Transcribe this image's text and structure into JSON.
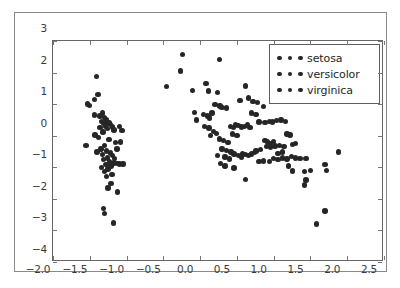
{
  "figure": {
    "background_color": "#ffffff",
    "frame_color": "#8a8a8a",
    "axes_color": "#666666",
    "marker_color": "#262626"
  },
  "legend": {
    "position": "upper-right",
    "entries": [
      {
        "label": "setosa",
        "marker": "circle",
        "color": "#262626"
      },
      {
        "label": "versicolor",
        "marker": "circle",
        "color": "#262626"
      },
      {
        "label": "virginica",
        "marker": "circle",
        "color": "#262626"
      }
    ]
  },
  "chart_data": {
    "type": "scatter",
    "title": "",
    "xlabel": "",
    "ylabel": "",
    "xlim": [
      -2.0,
      2.5
    ],
    "ylim": [
      -4,
      3
    ],
    "grid": false,
    "legend_position": "upper right",
    "xticks": [
      -2.0,
      -1.5,
      -1.0,
      -0.5,
      0.0,
      0.5,
      1.0,
      1.5,
      2.0,
      2.5
    ],
    "xticklabels": [
      "-2.0",
      "-1.5",
      "-1.0",
      "-0.5",
      "0.0",
      "0.5",
      "1.0",
      "1.5",
      "2.0",
      "2.5"
    ],
    "yticks": [
      -4,
      -3,
      -2,
      -1,
      0,
      1,
      2,
      3
    ],
    "yticklabels": [
      "-4",
      "-3",
      "-2",
      "-1",
      "0",
      "1",
      "2",
      "3"
    ],
    "marker_size": 5.4,
    "series": [
      {
        "name": "setosa",
        "color": "#262626",
        "points": [
          [
            -1.53,
            1.0
          ],
          [
            -1.41,
            1.88
          ],
          [
            -1.44,
            1.15
          ],
          [
            -1.39,
            1.3
          ],
          [
            -1.5,
            0.95
          ],
          [
            -1.33,
            0.72
          ],
          [
            -1.36,
            0.62
          ],
          [
            -1.3,
            0.58
          ],
          [
            -1.28,
            0.52
          ],
          [
            -1.34,
            0.46
          ],
          [
            -1.27,
            0.44
          ],
          [
            -1.24,
            0.4
          ],
          [
            -1.31,
            0.38
          ],
          [
            -1.22,
            0.35
          ],
          [
            -1.29,
            0.3
          ],
          [
            -1.19,
            0.28
          ],
          [
            -1.36,
            0.26
          ],
          [
            -1.26,
            0.22
          ],
          [
            -1.17,
            0.18
          ],
          [
            -1.32,
            0.12
          ],
          [
            -1.55,
            -0.3
          ],
          [
            -1.43,
            0.02
          ],
          [
            -1.38,
            -0.06
          ],
          [
            -1.24,
            -0.12
          ],
          [
            -1.15,
            -0.22
          ],
          [
            -1.3,
            -0.3
          ],
          [
            -1.35,
            -0.42
          ],
          [
            -1.27,
            -0.48
          ],
          [
            -1.22,
            -0.55
          ],
          [
            -1.33,
            -0.6
          ],
          [
            -1.4,
            -0.52
          ],
          [
            -1.19,
            -0.62
          ],
          [
            -1.26,
            -0.7
          ],
          [
            -1.31,
            -0.76
          ],
          [
            -1.23,
            -0.82
          ],
          [
            -1.17,
            -0.86
          ],
          [
            -1.12,
            -0.88
          ],
          [
            -1.28,
            -0.92
          ],
          [
            -1.21,
            -0.96
          ],
          [
            -1.34,
            -1.0
          ],
          [
            -1.25,
            -1.06
          ],
          [
            -1.3,
            -1.14
          ],
          [
            -1.2,
            -1.22
          ],
          [
            -1.27,
            -1.3
          ],
          [
            -1.16,
            -0.72
          ],
          [
            -1.1,
            -0.9
          ],
          [
            -1.05,
            -0.9
          ],
          [
            -1.13,
            -0.42
          ],
          [
            -1.08,
            -0.2
          ],
          [
            -1.1,
            0.3
          ],
          [
            -1.06,
            0.16
          ],
          [
            -1.44,
            0.66
          ],
          [
            -1.21,
            -1.52
          ],
          [
            -1.25,
            -1.66
          ],
          [
            -1.12,
            -1.78
          ],
          [
            -1.31,
            -2.3
          ],
          [
            -1.3,
            -2.46
          ],
          [
            -1.18,
            -2.76
          ]
        ]
      },
      {
        "name": "versicolor",
        "color": "#262626",
        "points": [
          [
            -0.46,
            1.55
          ],
          [
            -0.27,
            2.05
          ],
          [
            -0.24,
            2.58
          ],
          [
            0.26,
            2.42
          ],
          [
            -0.1,
            1.44
          ],
          [
            0.08,
            1.66
          ],
          [
            0.11,
            1.42
          ],
          [
            0.24,
            1.36
          ],
          [
            -0.08,
            0.74
          ],
          [
            -0.05,
            0.5
          ],
          [
            0.05,
            0.68
          ],
          [
            0.1,
            0.62
          ],
          [
            0.13,
            0.56
          ],
          [
            0.16,
            0.72
          ],
          [
            0.2,
            0.98
          ],
          [
            0.27,
            0.94
          ],
          [
            0.3,
            0.9
          ],
          [
            0.36,
            0.88
          ],
          [
            0.06,
            0.3
          ],
          [
            0.12,
            0.24
          ],
          [
            0.18,
            0.14
          ],
          [
            0.22,
            0.08
          ],
          [
            0.14,
            0.0
          ],
          [
            0.26,
            -0.1
          ],
          [
            0.32,
            -0.16
          ],
          [
            0.38,
            -0.22
          ],
          [
            0.41,
            0.3
          ],
          [
            0.45,
            0.26
          ],
          [
            0.48,
            0.34
          ],
          [
            0.52,
            0.32
          ],
          [
            0.56,
            0.28
          ],
          [
            0.6,
            0.3
          ],
          [
            0.64,
            0.34
          ],
          [
            0.68,
            0.26
          ],
          [
            0.44,
            0.06
          ],
          [
            0.5,
            0.0
          ],
          [
            0.3,
            -0.42
          ],
          [
            0.36,
            -0.46
          ],
          [
            0.42,
            -0.52
          ],
          [
            0.46,
            -0.58
          ],
          [
            0.34,
            -0.68
          ],
          [
            0.4,
            -0.74
          ],
          [
            0.52,
            -0.62
          ],
          [
            0.58,
            -0.58
          ],
          [
            0.62,
            -0.6
          ],
          [
            0.24,
            -0.62
          ],
          [
            0.28,
            -0.88
          ],
          [
            0.34,
            -0.96
          ],
          [
            0.46,
            -1.02
          ],
          [
            0.62,
            -1.38
          ],
          [
            0.56,
            -0.68
          ],
          [
            0.66,
            -0.62
          ],
          [
            0.7,
            -0.58
          ],
          [
            0.74,
            -0.54
          ],
          [
            0.8,
            -0.82
          ],
          [
            0.86,
            -0.8
          ]
        ]
      },
      {
        "name": "virginica",
        "color": "#262626",
        "points": [
          [
            0.62,
            1.58
          ],
          [
            0.54,
            1.12
          ],
          [
            0.66,
            1.2
          ],
          [
            0.72,
            1.08
          ],
          [
            0.78,
            1.06
          ],
          [
            0.7,
            0.72
          ],
          [
            0.76,
            0.68
          ],
          [
            0.86,
            0.92
          ],
          [
            0.8,
            0.44
          ],
          [
            0.88,
            0.42
          ],
          [
            0.94,
            0.46
          ],
          [
            0.98,
            0.44
          ],
          [
            1.04,
            0.48
          ],
          [
            1.1,
            0.5
          ],
          [
            1.16,
            0.46
          ],
          [
            0.88,
            -0.16
          ],
          [
            0.92,
            -0.2
          ],
          [
            0.96,
            -0.24
          ],
          [
            1.0,
            -0.18
          ],
          [
            0.9,
            -0.34
          ],
          [
            0.96,
            -0.36
          ],
          [
            1.02,
            -0.32
          ],
          [
            1.08,
            -0.3
          ],
          [
            1.14,
            -0.34
          ],
          [
            1.22,
            0.02
          ],
          [
            1.18,
            0.06
          ],
          [
            1.26,
            -0.28
          ],
          [
            1.3,
            -0.24
          ],
          [
            0.94,
            -0.82
          ],
          [
            1.0,
            -0.72
          ],
          [
            1.06,
            -0.76
          ],
          [
            1.12,
            -0.7
          ],
          [
            1.18,
            -0.74
          ],
          [
            1.24,
            -0.66
          ],
          [
            1.3,
            -0.7
          ],
          [
            1.36,
            -0.72
          ],
          [
            1.44,
            -0.72
          ],
          [
            1.2,
            -0.96
          ],
          [
            1.26,
            -1.12
          ],
          [
            1.42,
            -1.14
          ],
          [
            1.5,
            -1.1
          ],
          [
            1.44,
            -1.4
          ],
          [
            1.42,
            -1.56
          ],
          [
            1.7,
            -0.92
          ],
          [
            1.72,
            -1.1
          ],
          [
            1.88,
            -0.52
          ],
          [
            1.58,
            -2.8
          ],
          [
            1.7,
            -2.38
          ],
          [
            0.76,
            -0.48
          ],
          [
            0.82,
            -0.44
          ],
          [
            1.12,
            -0.52
          ],
          [
            1.06,
            -0.56
          ]
        ]
      }
    ]
  }
}
